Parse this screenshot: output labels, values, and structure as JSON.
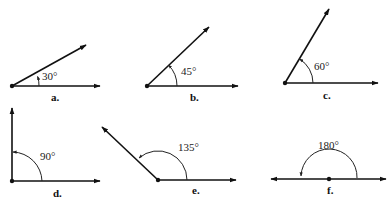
{
  "figure": {
    "angles": [
      {
        "id": "a",
        "label": "a.",
        "degrees": "30°",
        "value": 30
      },
      {
        "id": "b",
        "label": "b.",
        "degrees": "45°",
        "value": 45
      },
      {
        "id": "c",
        "label": "c.",
        "degrees": "60°",
        "value": 60
      },
      {
        "id": "d",
        "label": "d.",
        "degrees": "90°",
        "value": 90
      },
      {
        "id": "e",
        "label": "e.",
        "degrees": "135°",
        "value": 135
      },
      {
        "id": "f",
        "label": "f.",
        "degrees": "180°",
        "value": 180
      }
    ]
  },
  "colors": {
    "ink": "#111111",
    "background": "#ffffff"
  }
}
